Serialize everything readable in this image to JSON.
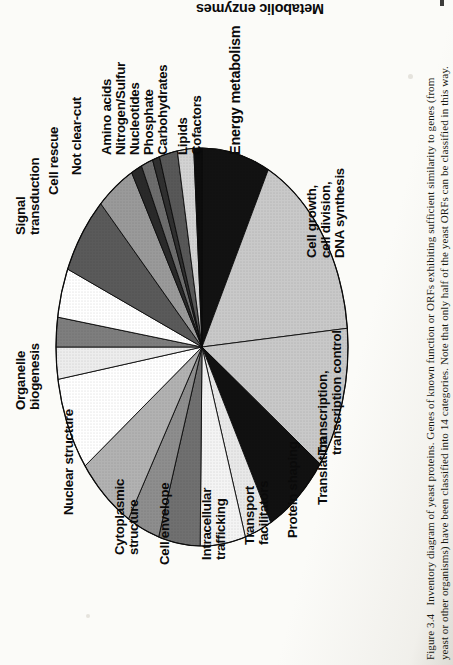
{
  "figure": {
    "number": "Figure 3.4",
    "caption_line1": "Figure 3.4   Inventory diagram of yeast proteins. Genes of known function or ORFs exhibiting sufficient similarity to genes (from",
    "caption_line2": "yeast or other organisms) have been classified into 14 categories. Note that only half of the yeast ORFs can be classified in this way.",
    "group_header": "Metabolic enzymes"
  },
  "chart_data": {
    "type": "pie",
    "title": "Inventory diagram of yeast proteins",
    "ylabel": "",
    "xlabel": "",
    "legend_position": "outside-labels",
    "grid": false,
    "categories": [
      "Energy metabolism",
      "Cell growth, cell division, DNA synthesis",
      "Transcription, transcription control",
      "Translation",
      "Protein shaping",
      "Transport facilitators",
      "Intracellular trafficking",
      "Cell envelope",
      "Cytoplasmic structure",
      "Nuclear structure",
      "Organelle biogenesis",
      "Signal transduction",
      "Cell rescue",
      "Not clear-cut",
      "Amino acids",
      "Nitrogen/Sulfur",
      "Nucleotides",
      "Phosphate",
      "Carbohydrates",
      "Lipids",
      "Cofactors"
    ],
    "values": [
      7.5,
      16.0,
      11.5,
      7.2,
      3.0,
      5.0,
      4.6,
      3.6,
      6.4,
      7.6,
      2.6,
      2.4,
      4.0,
      6.4,
      4.2,
      1.2,
      1.3,
      0.8,
      2.0,
      1.8,
      0.9
    ],
    "units": "percent of classified yeast ORFs",
    "slices": [
      {
        "label": "Energy metabolism",
        "value": 7.5,
        "fill": "#121212"
      },
      {
        "label": "Cell growth, cell division, DNA synthesis",
        "value": 16.0,
        "fill": "#c9c9c9"
      },
      {
        "label": "Transcription, transcription control",
        "value": 11.5,
        "fill": "#c9c9c9"
      },
      {
        "label": "Translation",
        "value": 7.2,
        "fill": "#111111"
      },
      {
        "label": "Protein shaping",
        "value": 3.0,
        "fill": "#e9e9e9"
      },
      {
        "label": "Transport facilitators",
        "value": 5.0,
        "fill": "#f4f4f4"
      },
      {
        "label": "Intracellular trafficking",
        "value": 4.6,
        "fill": "#707070"
      },
      {
        "label": "Cell envelope",
        "value": 3.6,
        "fill": "#8e8e8e"
      },
      {
        "label": "Cytoplasmic structure",
        "value": 6.4,
        "fill": "#b2b2b2"
      },
      {
        "label": "Nuclear structure",
        "value": 7.6,
        "fill": "#ffffff"
      },
      {
        "label": "Organelle biogenesis",
        "value": 2.6,
        "fill": "#ededed"
      },
      {
        "label": "Signal transduction",
        "value": 2.4,
        "fill": "#7e7e7e"
      },
      {
        "label": "Cell rescue",
        "value": 4.0,
        "fill": "#ffffff"
      },
      {
        "label": "Not clear-cut",
        "value": 6.4,
        "fill": "#5a5a5a"
      },
      {
        "label": "Amino acids",
        "value": 4.2,
        "fill": "#9a9a9a"
      },
      {
        "label": "Nitrogen/Sulfur",
        "value": 1.2,
        "fill": "#2a2a2a"
      },
      {
        "label": "Nucleotides",
        "value": 1.3,
        "fill": "#6d6d6d"
      },
      {
        "label": "Phosphate",
        "value": 0.8,
        "fill": "#303030"
      },
      {
        "label": "Carbohydrates",
        "value": 2.0,
        "fill": "#585858"
      },
      {
        "label": "Lipids",
        "value": 1.8,
        "fill": "#d3d3d3"
      },
      {
        "label": "Cofactors",
        "value": 0.9,
        "fill": "#0d0d0d"
      }
    ],
    "annotations": [
      "Metabolic enzymes"
    ]
  },
  "labels": {
    "metabolic_enzymes": "Metabolic enzymes",
    "amino_acids": "Amino acids",
    "nitrogen_sulfur": "Nitrogen/Sulfur",
    "nucleotides": "Nucleotides",
    "phosphate": "Phosphate",
    "carbohydrates": "Carbohydrates",
    "lipids": "Lipids",
    "cofactors": "Cofactors",
    "energy_metabolism": "Energy metabolism",
    "not_clear_cut": "Not clear-cut",
    "cell_rescue": "Cell rescue",
    "signal_transduction_1": "Signal",
    "signal_transduction_2": "transduction",
    "organelle_1": "Organelle",
    "organelle_2": "biogenesis",
    "nuclear_structure": "Nuclear structure",
    "cytoplasmic_1": "Cytoplasmic",
    "cytoplasmic_2": "structure",
    "cell_envelope": "Cell envelope",
    "intracellular_1": "Intracellular",
    "intracellular_2": "trafficking",
    "transport_1": "Transport",
    "transport_2": "facilitators",
    "protein_shaping": "Protein shaping",
    "translation": "Translation",
    "transcription_1": "Transcription,",
    "transcription_2": "transcription control",
    "cell_growth_1": "Cell growth,",
    "cell_growth_2": "cell division,",
    "cell_growth_3": "DNA synthesis"
  }
}
